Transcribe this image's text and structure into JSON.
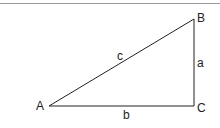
{
  "diagram": {
    "vertices": [
      {
        "name": "A",
        "x": 49,
        "y": 106
      },
      {
        "name": "B",
        "x": 194,
        "y": 19
      },
      {
        "name": "C",
        "x": 194,
        "y": 106
      }
    ],
    "vertex_labels": {
      "A": "A",
      "B": "B",
      "C": "C"
    },
    "side_labels": {
      "a": "a",
      "b": "b",
      "c": "c"
    },
    "line_color": "#222222",
    "rule_color": "#9a9a9a"
  }
}
